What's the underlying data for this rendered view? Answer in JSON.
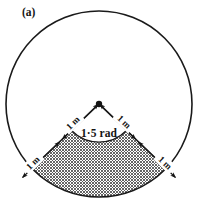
{
  "figure": {
    "panel_label": "(a)",
    "angle_label": "1·5 rad",
    "angle_value_rad": 1.5,
    "radius_label": "1 m",
    "radius_value_m": 1,
    "colors": {
      "ink": "#1a1a1a",
      "background": "#ffffff",
      "hatch": "#4a4a4a"
    },
    "shape": {
      "outline": "circle",
      "shaded_region": "circular-segment-below-sector-arc",
      "shading": "cross-hatch"
    },
    "dimension_labels": [
      {
        "name": "left-arm-outer",
        "text": "1 m"
      },
      {
        "name": "left-arm-inner",
        "text": "1 m"
      },
      {
        "name": "right-arm-inner",
        "text": "1 m"
      },
      {
        "name": "right-arm-outer",
        "text": "1 m"
      }
    ]
  }
}
